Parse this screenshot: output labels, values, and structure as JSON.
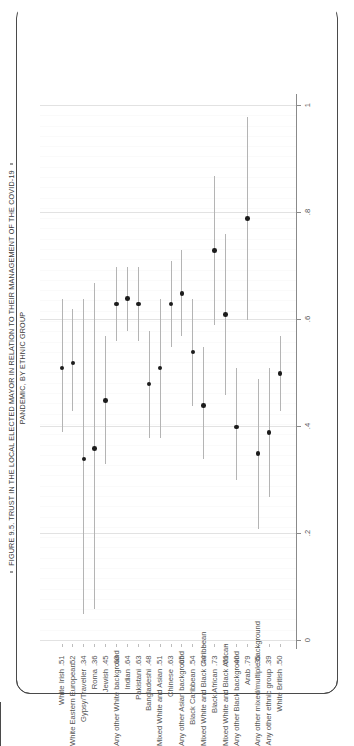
{
  "figure": {
    "title_line_1": "FIGURE 9.5. TRUST IN THE LOCAL ELECTED MAYOR IN RELATION TO THEIR MANAGEMENT OF THE COVID-19",
    "title_line_2": "PANDEMIC, BY ETHNIC GROUP",
    "bullet_icon": "square-bullet"
  },
  "chart_data": {
    "type": "scatter",
    "title": "FIGURE 9.5. TRUST IN THE LOCAL ELECTED MAYOR IN RELATION TO THEIR MANAGEMENT OF THE COVID-19 PANDEMIC, BY ETHNIC GROUP",
    "orientation": "horizontal-category-axis-rotated",
    "xlabel": "",
    "ylabel": "",
    "ylim": [
      0,
      1
    ],
    "grid": true,
    "legend": null,
    "tick_labels": [
      "0",
      ".2",
      ".4",
      ".6",
      ".8",
      "1"
    ],
    "tick_values": [
      0,
      0.2,
      0.4,
      0.6,
      0.8,
      1
    ],
    "categories": [
      "White Irish",
      "White Eastern European",
      "Gypsy/Traveller",
      "Roma",
      "Jewish",
      "Any other White background",
      "Indian",
      "Pakistani",
      "Bangladeshi",
      "Mixed White and Asian",
      "Chinese",
      "Any other Asian background",
      "Black Caribbean",
      "Mixed White and Black Caribbean",
      "Black African",
      "Mixed White and Black African",
      "Any other Black background",
      "Arab",
      "Any other mixed/multiple background",
      "Any other ethnic group",
      "White British"
    ],
    "value_labels": [
      ".51",
      ".52",
      ".34",
      ".36",
      ".45",
      ".63",
      ".64",
      ".63",
      ".48",
      ".51",
      ".63",
      ".65",
      ".54",
      ".44",
      ".73",
      ".61",
      ".40",
      ".79",
      ".35",
      ".39",
      ".50"
    ],
    "values": [
      0.51,
      0.52,
      0.34,
      0.36,
      0.45,
      0.63,
      0.64,
      0.63,
      0.48,
      0.51,
      0.63,
      0.65,
      0.54,
      0.44,
      0.73,
      0.61,
      0.4,
      0.79,
      0.35,
      0.39,
      0.5
    ],
    "ci_low": [
      0.39,
      0.43,
      0.05,
      0.06,
      0.33,
      0.56,
      0.58,
      0.56,
      0.38,
      0.38,
      0.55,
      0.57,
      0.44,
      0.34,
      0.59,
      0.46,
      0.3,
      0.6,
      0.21,
      0.27,
      0.43
    ],
    "ci_high": [
      0.64,
      0.62,
      0.64,
      0.67,
      0.57,
      0.7,
      0.7,
      0.7,
      0.58,
      0.64,
      0.71,
      0.73,
      0.64,
      0.55,
      0.87,
      0.76,
      0.51,
      0.98,
      0.49,
      0.51,
      0.57
    ]
  }
}
